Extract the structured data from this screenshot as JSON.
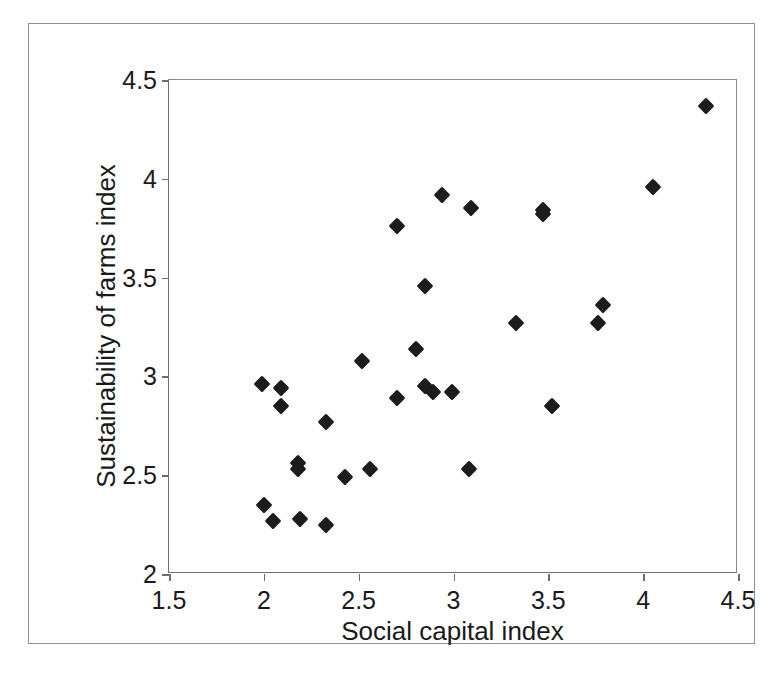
{
  "chart_data": {
    "type": "scatter",
    "title": "",
    "xlabel": "Social capital index",
    "ylabel": "Sustainability of farms index",
    "xlim": [
      1.5,
      4.5
    ],
    "ylim": [
      2,
      4.5
    ],
    "xticks": [
      "1.5",
      "2",
      "2.5",
      "3",
      "3.5",
      "4",
      "4.5"
    ],
    "xtick_values": [
      1.5,
      2,
      2.5,
      3,
      3.5,
      4,
      4.5
    ],
    "yticks": [
      "2",
      "2.5",
      "3",
      "3.5",
      "4",
      "4.5"
    ],
    "ytick_values": [
      2,
      2.5,
      3,
      3.5,
      4,
      4.5
    ],
    "grid": false,
    "legend": null,
    "marker": "diamond",
    "marker_color": "#1c1c1c",
    "points": [
      {
        "x": 1.99,
        "y": 2.96
      },
      {
        "x": 2.09,
        "y": 2.94
      },
      {
        "x": 2.09,
        "y": 2.85
      },
      {
        "x": 2.0,
        "y": 2.35
      },
      {
        "x": 2.05,
        "y": 2.27
      },
      {
        "x": 2.18,
        "y": 2.56
      },
      {
        "x": 2.18,
        "y": 2.53
      },
      {
        "x": 2.19,
        "y": 2.28
      },
      {
        "x": 2.33,
        "y": 2.77
      },
      {
        "x": 2.33,
        "y": 2.25
      },
      {
        "x": 2.43,
        "y": 2.49
      },
      {
        "x": 2.52,
        "y": 3.08
      },
      {
        "x": 2.56,
        "y": 2.53
      },
      {
        "x": 2.7,
        "y": 3.76
      },
      {
        "x": 2.7,
        "y": 2.89
      },
      {
        "x": 2.8,
        "y": 3.14
      },
      {
        "x": 2.85,
        "y": 3.46
      },
      {
        "x": 2.85,
        "y": 2.95
      },
      {
        "x": 2.89,
        "y": 2.92
      },
      {
        "x": 2.94,
        "y": 3.92
      },
      {
        "x": 2.99,
        "y": 2.92
      },
      {
        "x": 3.09,
        "y": 3.85
      },
      {
        "x": 3.08,
        "y": 2.53
      },
      {
        "x": 3.33,
        "y": 3.27
      },
      {
        "x": 3.47,
        "y": 3.84
      },
      {
        "x": 3.47,
        "y": 3.82
      },
      {
        "x": 3.52,
        "y": 2.85
      },
      {
        "x": 3.76,
        "y": 3.27
      },
      {
        "x": 3.79,
        "y": 3.36
      },
      {
        "x": 4.05,
        "y": 3.96
      },
      {
        "x": 4.33,
        "y": 4.37
      }
    ]
  }
}
